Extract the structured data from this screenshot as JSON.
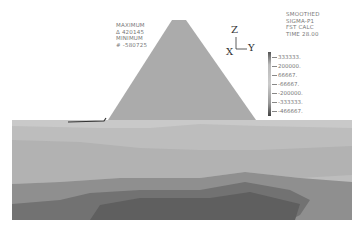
{
  "result_info": {
    "maximum_label": "MAXIMUM",
    "maximum_value": "Δ 420145",
    "minimum_label": "MINIMUM",
    "minimum_value": "# -580725"
  },
  "plot_info": {
    "line1": "SMOOTHED",
    "line2": "SIGMA-P1",
    "line3": "FST CALC",
    "line4": "TIME 28.00"
  },
  "axes": {
    "z": "Z",
    "x": "X",
    "y": "Y"
  },
  "legend": {
    "values": [
      "333333.",
      "200000.",
      "66667.",
      "-66667.",
      "-200000.",
      "-333333.",
      "-466667."
    ]
  },
  "colors": {
    "dam": "#a9a9a9",
    "band_top": "#c4c4c4",
    "band_2": "#b6b6b6",
    "band_3": "#a8a8a8",
    "band_4": "#8c8c8c",
    "band_5": "#6e6e6e",
    "water_line": "#333333"
  }
}
